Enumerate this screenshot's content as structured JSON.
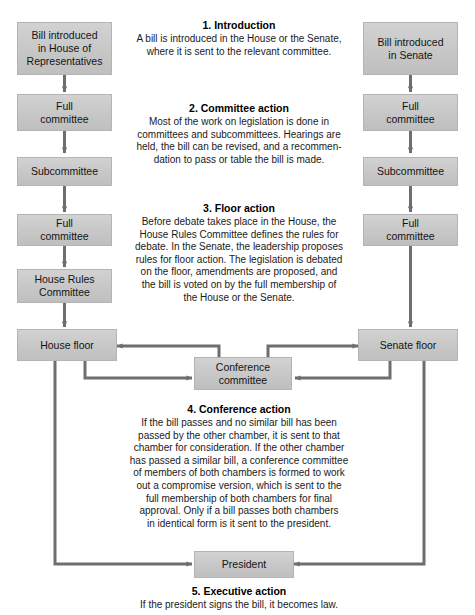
{
  "diagram": {
    "colors": {
      "box_fill": "#c7c7c7",
      "box_border": "#b4b4b4",
      "arrow": "#6e6e6e",
      "text": "#1a1a1a"
    }
  },
  "house_column": {
    "boxes": [
      {
        "id": "house-bill-introduced",
        "label": "Bill introduced\nin House of\nRepresentatives"
      },
      {
        "id": "house-full-committee-1",
        "label": "Full\ncommittee"
      },
      {
        "id": "house-subcommittee",
        "label": "Subcommittee"
      },
      {
        "id": "house-full-committee-2",
        "label": "Full\ncommittee"
      },
      {
        "id": "house-rules-committee",
        "label": "House Rules\nCommittee"
      },
      {
        "id": "house-floor",
        "label": "House floor"
      }
    ]
  },
  "senate_column": {
    "boxes": [
      {
        "id": "senate-bill-introduced",
        "label": "Bill introduced\nin Senate"
      },
      {
        "id": "senate-full-committee-1",
        "label": "Full\ncommittee"
      },
      {
        "id": "senate-subcommittee",
        "label": "Subcommittee"
      },
      {
        "id": "senate-full-committee-2",
        "label": "Full\ncommittee"
      },
      {
        "id": "senate-floor",
        "label": "Senate floor"
      }
    ]
  },
  "center_column": {
    "conference_committee": {
      "label": "Conference\ncommittee"
    },
    "president": {
      "label": "President"
    }
  },
  "steps": [
    {
      "number": "1.",
      "title": "1.  Introduction",
      "body": "A bill is introduced in the House or the Senate,\nwhere it is sent to the relevant committee."
    },
    {
      "number": "2.",
      "title": "2.  Committee action",
      "body": "Most of the work on legislation is done in\ncommittees and subcommittees. Hearings are\nheld, the bill can be revised, and a recommen-\ndation to pass or table the bill is made."
    },
    {
      "number": "3.",
      "title": "3.  Floor action",
      "body": "Before debate takes place in the House, the\nHouse Rules Committee defines the rules for\ndebate. In the Senate, the leadership proposes\nrules for floor action. The legislation is debated\non the floor, amendments are proposed, and\nthe bill is voted on by the full membership of\nthe House or the Senate."
    },
    {
      "number": "4.",
      "title": "4.  Conference action",
      "body": "If the bill passes and no similar bill has been\npassed by the other chamber, it is sent to that\nchamber for consideration. If the other chamber\nhas passed a similar bill, a conference committee\nof members of both chambers is formed to work\nout a compromise version, which is sent to the\nfull membership of both chambers for final\napproval. Only if a bill passes both chambers\nin identical form is it sent to the president."
    },
    {
      "number": "5.",
      "title": "5.  Executive action",
      "body": "If the president signs the bill, it becomes law."
    }
  ]
}
